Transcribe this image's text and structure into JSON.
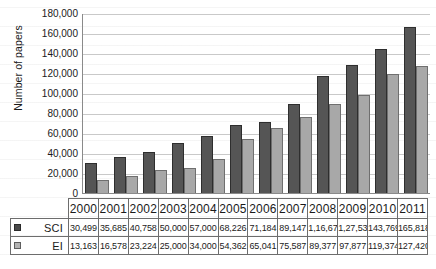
{
  "chart_data": {
    "type": "bar",
    "title": "",
    "xlabel": "",
    "ylabel": "Number of papers",
    "ylim": [
      0,
      180000
    ],
    "ytick_step": 20000,
    "yticks": [
      "0",
      "20,000",
      "40,000",
      "60,000",
      "80,000",
      "100,000",
      "120,000",
      "140,000",
      "160,000",
      "180,000"
    ],
    "grid": true,
    "legend_position": "table-left",
    "categories": [
      "2000",
      "2001",
      "2002",
      "2003",
      "2004",
      "2005",
      "2006",
      "2007",
      "2008",
      "2009",
      "2010",
      "2011"
    ],
    "series": [
      {
        "name": "SCI",
        "color": "#555555",
        "values": [
          30499,
          35685,
          40758,
          50000,
          57000,
          68226,
          71184,
          89147,
          116677,
          127532,
          143769,
          165818
        ],
        "labels": [
          "30,499",
          "35,685",
          "40,758",
          "50,000",
          "57,000",
          "68,226",
          "71,184",
          "89,147",
          "1,16,677",
          "1,27,532",
          "143,769",
          "165,818"
        ]
      },
      {
        "name": "EI",
        "color": "#a8a8a8",
        "values": [
          13163,
          16578,
          23224,
          25000,
          34000,
          54362,
          65041,
          75587,
          89377,
          97877,
          119374,
          127420
        ],
        "labels": [
          "13,163",
          "16,578",
          "23,224",
          "25,000",
          "34,000",
          "54,362",
          "65,041",
          "75,587",
          "89,377",
          "97,877",
          "119,374",
          "127,420"
        ]
      }
    ]
  },
  "legend": {
    "sci_label": "SCI",
    "ei_label": "EI",
    "sci_swatch": "sci-swatch-icon",
    "ei_swatch": "ei-swatch-icon"
  }
}
